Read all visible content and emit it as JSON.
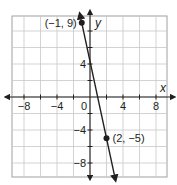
{
  "chart_data": {
    "type": "line",
    "title": "",
    "xlabel": "x",
    "ylabel": "y",
    "xlim": [
      -9.5,
      9.5
    ],
    "ylim": [
      -9.75,
      9.75
    ],
    "grid": true,
    "grid_step": 2,
    "x_ticks": [
      -8,
      -4,
      0,
      4,
      8
    ],
    "y_ticks": [
      4,
      -4,
      -8
    ],
    "x_tick_labels": [
      "−8",
      "−4",
      "0",
      "4",
      "8"
    ],
    "y_tick_labels": [
      "4",
      "−4",
      "−8"
    ],
    "series": [
      {
        "name": "line",
        "slope": -4.6667,
        "intercept": 4.3333,
        "points": [
          {
            "x": -1,
            "y": 9,
            "label": "(−1, 9)"
          },
          {
            "x": 2,
            "y": -5,
            "label": "(2, −5)"
          }
        ]
      }
    ],
    "colors": {
      "grid": "#c8c8c8",
      "axes": "#231f20",
      "line": "#231f20",
      "border": "#a0a0a0"
    }
  }
}
